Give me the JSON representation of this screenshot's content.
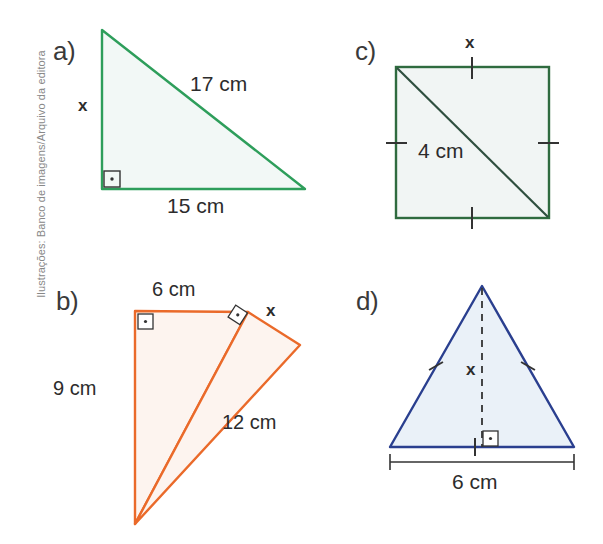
{
  "page": {
    "width": 603,
    "height": 544,
    "background": "#ffffff",
    "credit": "Ilustrações: Banco de imagens/Arquivo da editora"
  },
  "colors": {
    "green": "#2e9e5b",
    "green_fill": "#f2f8f6",
    "orange": "#ea6a2a",
    "orange_fill": "#fdf4ef",
    "blue": "#2a3f8f",
    "blue_fill": "#eaf1f8",
    "square_stroke": "#2f6b3f",
    "square_fill": "#f1f5f4",
    "text": "#2c2c2c",
    "label": "#3a3a3a",
    "credit": "#888888",
    "mark": "#333333"
  },
  "figures": [
    {
      "id": "a",
      "label": "a)",
      "shape": "right-triangle",
      "color": "#2e9e5b",
      "labels": {
        "hypotenuse": "17 cm",
        "base": "15 cm",
        "unknown": "x"
      },
      "marks": [
        "right-angle-bottom-left"
      ]
    },
    {
      "id": "b",
      "label": "b)",
      "shape": "two-right-triangles",
      "color": "#ea6a2a",
      "labels": {
        "top": "6 cm",
        "left": "9 cm",
        "slant": "12 cm",
        "unknown": "x"
      },
      "marks": [
        "right-angle-top-left",
        "right-angle-rotated-top-right"
      ]
    },
    {
      "id": "c",
      "label": "c)",
      "shape": "square-with-diagonal",
      "color": "#2f6b3f",
      "labels": {
        "diagonal": "4 cm",
        "unknown": "x"
      },
      "marks": [
        "tick-top",
        "tick-bottom",
        "tick-left",
        "tick-right"
      ]
    },
    {
      "id": "d",
      "label": "d)",
      "shape": "isosceles-triangle-with-height",
      "color": "#2a3f8f",
      "labels": {
        "base": "6 cm",
        "unknown": "x"
      },
      "marks": [
        "tick-left-side",
        "tick-right-side",
        "tick-base-midpoint",
        "right-angle-foot",
        "dimension-line-base"
      ]
    }
  ]
}
